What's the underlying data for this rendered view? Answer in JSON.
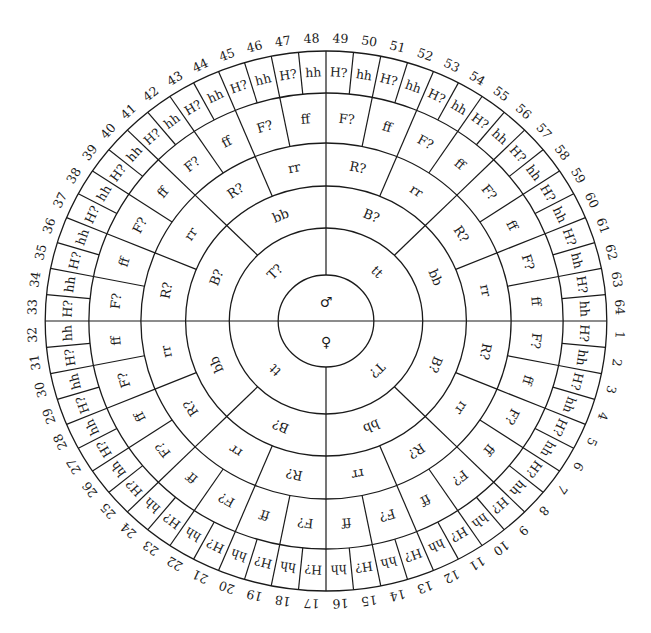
{
  "diagram": {
    "type": "circular-genotype-wheel",
    "center_labels": {
      "top": "♂",
      "bottom": "♀"
    },
    "rings": [
      {
        "name": "T",
        "sectors": 4,
        "labels_clockwise_from_top": [
          "tt",
          "T?",
          "tt",
          "T?"
        ],
        "note": "starts right of top vertical line: tt, T?, tt, T?"
      },
      {
        "name": "B",
        "sectors": 8,
        "labels_clockwise_from_top": [
          "B?",
          "bb",
          "B?",
          "bb",
          "B?",
          "bb",
          "B?",
          "bb"
        ]
      },
      {
        "name": "R",
        "sectors": 16,
        "pattern": [
          "R?",
          "rr"
        ]
      },
      {
        "name": "F",
        "sectors": 32,
        "pattern": [
          "F?",
          "ff"
        ]
      },
      {
        "name": "H",
        "sectors": 64,
        "pattern": [
          "H?",
          "hh"
        ]
      }
    ],
    "numbering": {
      "count": 64,
      "start_position": "just below 3 o'clock, increasing clockwise",
      "labels": [
        "1",
        "2",
        "3",
        "4",
        "5",
        "6",
        "7",
        "8",
        "9",
        "10",
        "11",
        "12",
        "13",
        "14",
        "15",
        "16",
        "17",
        "18",
        "19",
        "20",
        "21",
        "22",
        "23",
        "24",
        "25",
        "26",
        "27",
        "28",
        "29",
        "30",
        "31",
        "32",
        "33",
        "34",
        "35",
        "36",
        "37",
        "38",
        "39",
        "40",
        "41",
        "42",
        "43",
        "44",
        "45",
        "46",
        "47",
        "48",
        "49",
        "50",
        "51",
        "52",
        "53",
        "54",
        "55",
        "56",
        "57",
        "58",
        "59",
        "60",
        "61",
        "62",
        "63",
        "64"
      ]
    },
    "outer_labels_by_number": {
      "odd": "H?",
      "even": "hh"
    },
    "colors": {
      "ink": "#1a1a1a",
      "background": "#ffffff"
    }
  }
}
